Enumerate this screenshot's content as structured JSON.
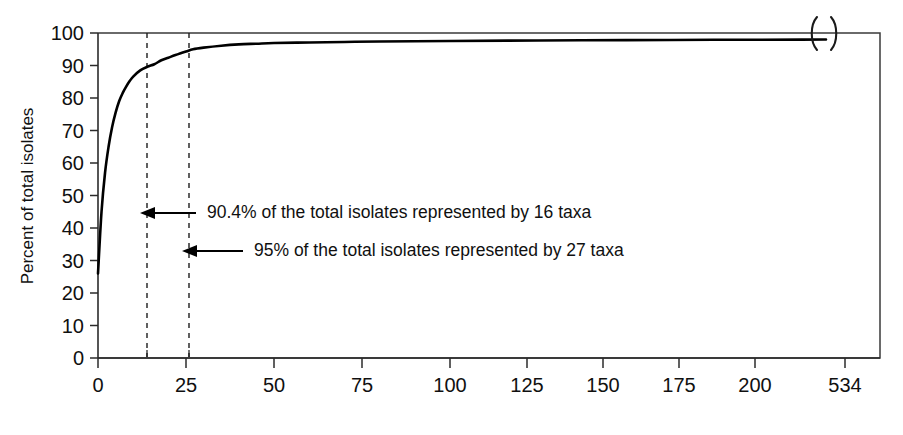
{
  "chart_data": {
    "type": "line",
    "title": "",
    "subtitle": "",
    "xlabel": "",
    "ylabel": "Percent of total isolates",
    "xlim": [
      0,
      534
    ],
    "ylim": [
      0,
      100
    ],
    "grid": false,
    "legend": "none",
    "axis_break": {
      "present": true,
      "after_value": 205,
      "final_tick_label": "534",
      "symbol": "parenthesis-break"
    },
    "x_ticks": [
      0,
      25,
      50,
      75,
      100,
      125,
      150,
      175,
      200,
      534
    ],
    "x_tick_labels": [
      "0",
      "25",
      "50",
      "75",
      "100",
      "125",
      "150",
      "175",
      "200",
      "534"
    ],
    "x_minor_ticks": [
      16,
      27
    ],
    "y_ticks": [
      0,
      10,
      20,
      30,
      40,
      50,
      60,
      70,
      80,
      90,
      100
    ],
    "y_tick_labels": [
      "0",
      "10",
      "20",
      "30",
      "40",
      "50",
      "60",
      "70",
      "80",
      "90",
      "100"
    ],
    "series": [
      {
        "name": "Cumulative percent of total isolates",
        "color": "#000000",
        "x": [
          0,
          1,
          2,
          3,
          4,
          5,
          6,
          7,
          8,
          9,
          10,
          12,
          14,
          16,
          18,
          20,
          22,
          25,
          27,
          30,
          35,
          40,
          45,
          50,
          60,
          70,
          80,
          100,
          125,
          150,
          175,
          200,
          534
        ],
        "y": [
          26.0,
          45.0,
          57.0,
          65.0,
          71.0,
          75.5,
          79.0,
          81.5,
          83.5,
          85.2,
          86.6,
          88.5,
          89.6,
          90.4,
          91.6,
          92.4,
          93.2,
          94.3,
          95.0,
          95.5,
          96.1,
          96.5,
          96.7,
          96.9,
          97.1,
          97.25,
          97.4,
          97.55,
          97.7,
          97.8,
          97.9,
          97.95,
          98.0
        ]
      }
    ],
    "reference_lines": [
      {
        "name": "16-taxa-line",
        "x": 16,
        "style": "dashed"
      },
      {
        "name": "27-taxa-line",
        "x": 27,
        "style": "dashed"
      }
    ],
    "annotations": [
      {
        "id": "annotation-90-4",
        "text": "90.4% of the total isolates represented by 16 taxa",
        "percent": 90.4,
        "taxa": 16,
        "points_to_x": 16,
        "arrow_from_x": 27,
        "y_position": 47
      },
      {
        "id": "annotation-95",
        "text": "95% of the total isolates represented by 27 taxa",
        "percent": 95,
        "taxa": 27,
        "points_to_x": 27,
        "arrow_from_x": 50,
        "y_position": 36
      }
    ]
  },
  "axes": {
    "y_title": "Percent of total isolates",
    "x_title": ""
  },
  "annotations": {
    "first": "90.4% of the total isolates represented by 16 taxa",
    "second": "95% of the total isolates represented by 27 taxa"
  },
  "y_tick_labels": {
    "t0": "0",
    "t1": "10",
    "t2": "20",
    "t3": "30",
    "t4": "40",
    "t5": "50",
    "t6": "60",
    "t7": "70",
    "t8": "80",
    "t9": "90",
    "t10": "100"
  },
  "x_tick_labels": {
    "t0": "0",
    "t1": "25",
    "t2": "50",
    "t3": "75",
    "t4": "100",
    "t5": "125",
    "t6": "150",
    "t7": "175",
    "t8": "200",
    "t9": "534"
  },
  "colors": {
    "curve": "#000000",
    "axis": "#2b2b2b",
    "background": "#ffffff"
  }
}
